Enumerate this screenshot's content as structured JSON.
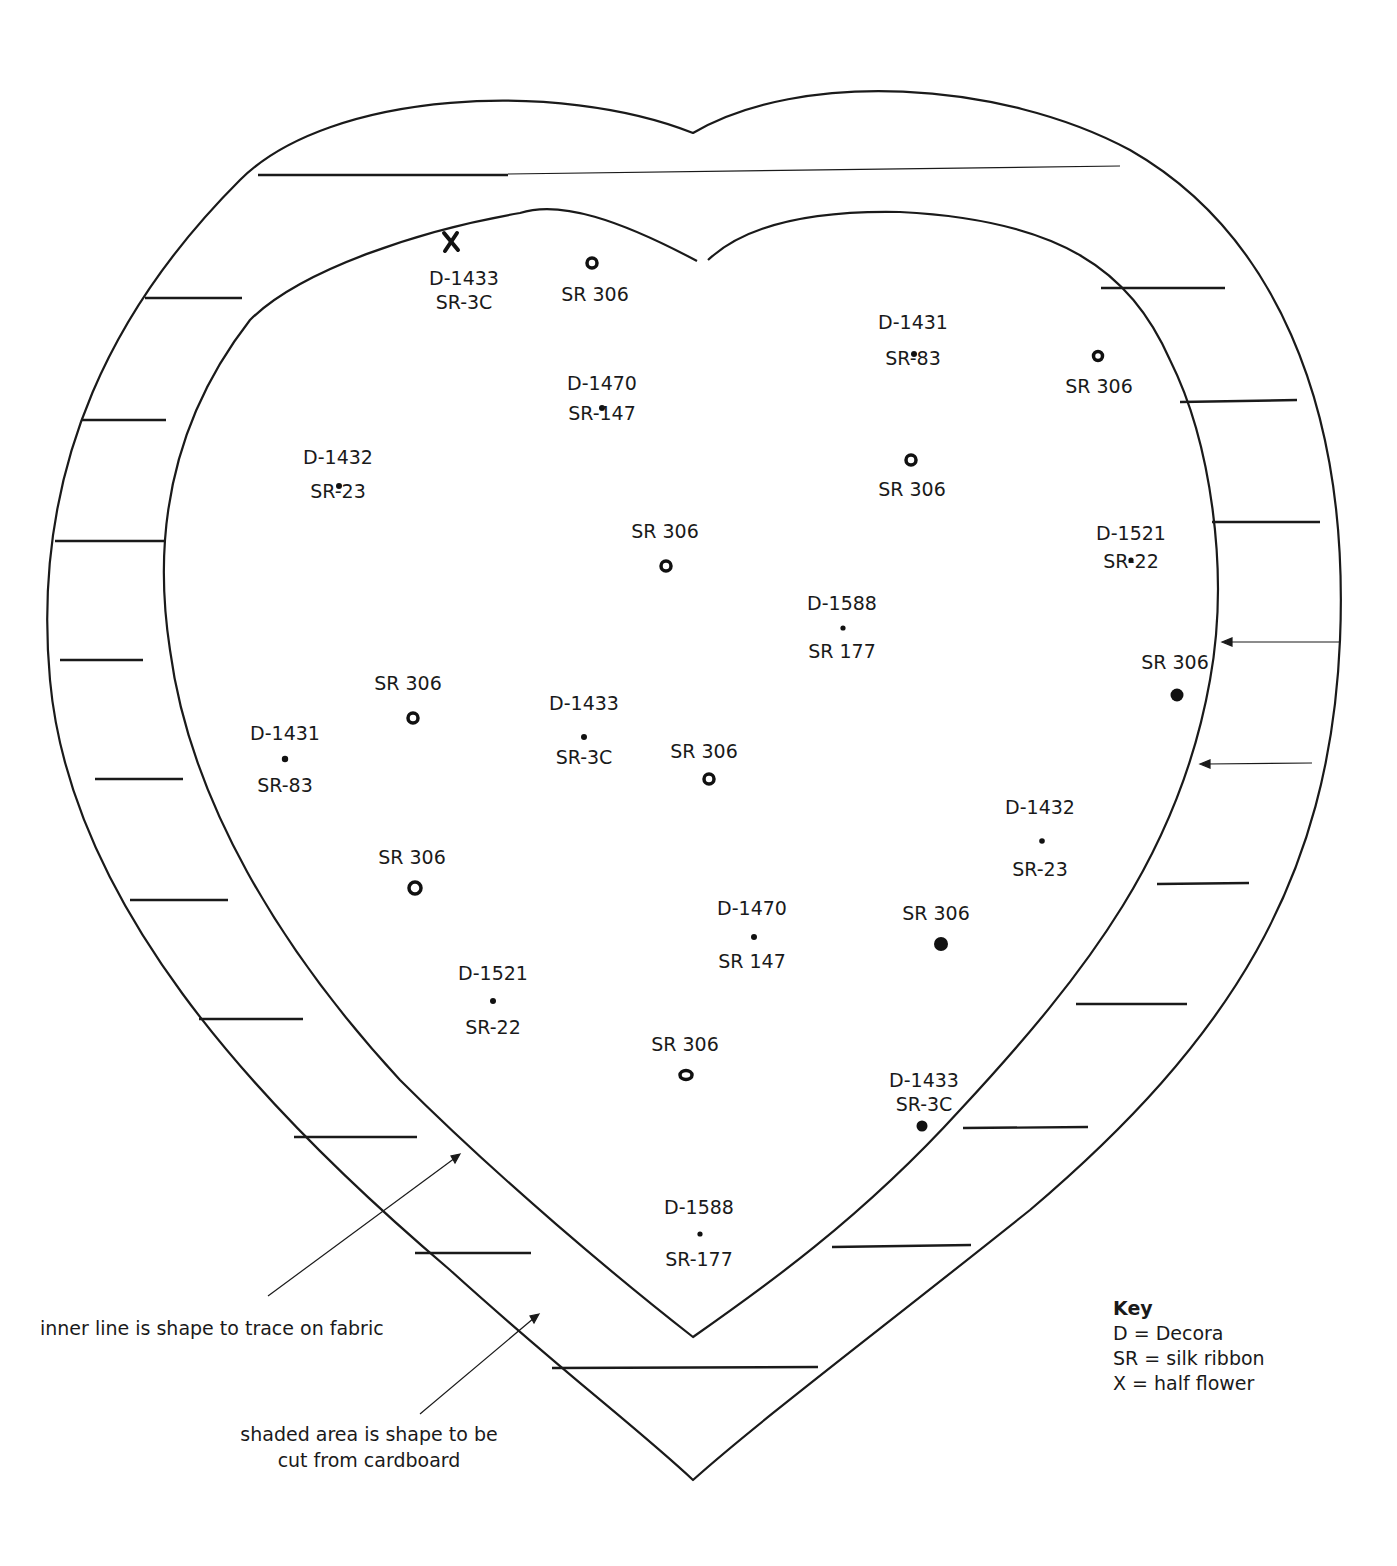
{
  "diagram": {
    "labels": [
      {
        "id": "x-top",
        "line1": "D-1433",
        "line2": "SR-3C",
        "x": 467,
        "y": 266,
        "marker": "x"
      },
      {
        "id": "sr306-top",
        "line1": "",
        "line2": "SR 306",
        "x": 595,
        "y": 283,
        "marker": "ring"
      },
      {
        "id": "d1431-r",
        "line1": "D-1431",
        "line2": "SR-83",
        "x": 913,
        "y": 311,
        "marker": "dot"
      },
      {
        "id": "sr306-r1",
        "line1": "",
        "line2": "SR 306",
        "x": 1099,
        "y": 374,
        "marker": "ring"
      },
      {
        "id": "d1470-t",
        "line1": "D-1470",
        "line2": "SR-147",
        "x": 602,
        "y": 372,
        "marker": "dot"
      },
      {
        "id": "d1432-l",
        "line1": "D-1432",
        "line2": "SR-23",
        "x": 338,
        "y": 446,
        "marker": "dot"
      },
      {
        "id": "sr306-r2",
        "line1": "",
        "line2": "SR 306",
        "x": 912,
        "y": 477,
        "marker": "ring"
      },
      {
        "id": "sr306-c1",
        "line1": "SR 306",
        "line2": "",
        "x": 665,
        "y": 520,
        "marker": "ring"
      },
      {
        "id": "d1521-r",
        "line1": "D-1521",
        "line2": "SR-22",
        "x": 1131,
        "y": 522,
        "marker": "dot"
      },
      {
        "id": "d1588-c",
        "line1": "D-1588",
        "line2": "SR 177",
        "x": 842,
        "y": 592,
        "marker": "dot"
      },
      {
        "id": "sr306-r3",
        "line1": "SR 306",
        "line2": "",
        "x": 1175,
        "y": 651,
        "marker": "filled"
      },
      {
        "id": "sr306-l1",
        "line1": "SR 306",
        "line2": "",
        "x": 408,
        "y": 672,
        "marker": "ring"
      },
      {
        "id": "d1433-c",
        "line1": "D-1433",
        "line2": "SR-3C",
        "x": 584,
        "y": 692,
        "marker": "dot"
      },
      {
        "id": "d1431-l",
        "line1": "D-1431",
        "line2": "SR-83",
        "x": 285,
        "y": 722,
        "marker": "dot"
      },
      {
        "id": "sr306-c2",
        "line1": "SR 306",
        "line2": "",
        "x": 704,
        "y": 740,
        "marker": "ring"
      },
      {
        "id": "d1432-r",
        "line1": "D-1432",
        "line2": "SR-23",
        "x": 1040,
        "y": 796,
        "marker": "dot"
      },
      {
        "id": "sr306-l2",
        "line1": "SR 306",
        "line2": "",
        "x": 412,
        "y": 846,
        "marker": "ring"
      },
      {
        "id": "d1470-b",
        "line1": "D-1470",
        "line2": "SR 147",
        "x": 752,
        "y": 897,
        "marker": "dot"
      },
      {
        "id": "sr306-r4",
        "line1": "SR 306",
        "line2": "",
        "x": 936,
        "y": 902,
        "marker": "filled"
      },
      {
        "id": "d1521-l",
        "line1": "D-1521",
        "line2": "SR-22",
        "x": 493,
        "y": 962,
        "marker": "dot"
      },
      {
        "id": "sr306-b",
        "line1": "SR 306",
        "line2": "",
        "x": 685,
        "y": 1033,
        "marker": "ring"
      },
      {
        "id": "d1433-b",
        "line1": "D-1433",
        "line2": "SR-3C",
        "x": 924,
        "y": 1068,
        "marker": "filled"
      },
      {
        "id": "d1588-b",
        "line1": "D-1588",
        "line2": "SR-177",
        "x": 699,
        "y": 1196,
        "marker": "dot"
      }
    ],
    "notes": {
      "inner_line": "inner line is shape to trace on fabric",
      "shaded_area_1": "shaded area is shape to be",
      "shaded_area_2": "cut from cardboard"
    },
    "key": {
      "title": "Key",
      "items": [
        "D = Decora",
        "SR = silk ribbon",
        "X = half flower"
      ]
    }
  }
}
